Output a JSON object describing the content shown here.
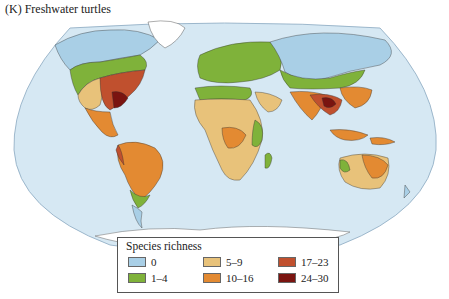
{
  "figure": {
    "title": "(K) Freshwater turtles"
  },
  "legend": {
    "title": "Species richness",
    "items": [
      {
        "label": "0",
        "color": "#a9cfe6"
      },
      {
        "label": "1–4",
        "color": "#7fb23a"
      },
      {
        "label": "5–9",
        "color": "#e8c27a"
      },
      {
        "label": "10–16",
        "color": "#e38a32"
      },
      {
        "label": "17–23",
        "color": "#c0502e"
      },
      {
        "label": "24–30",
        "color": "#7a1410"
      }
    ]
  },
  "colors": {
    "ocean": "#d6e8f3",
    "ocean_edge": "#8aa8c0",
    "antarctica": "#ffffff"
  }
}
